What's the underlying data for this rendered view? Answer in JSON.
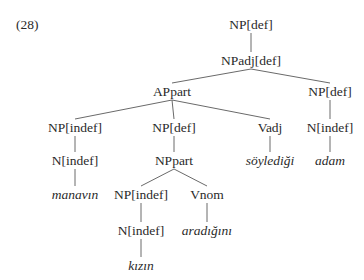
{
  "example_number": "(28)",
  "tree": {
    "nodes": [
      {
        "id": "n1",
        "label": "NP[def]",
        "type": "category"
      },
      {
        "id": "n2",
        "label": "NPadj[def]",
        "type": "category"
      },
      {
        "id": "n3",
        "label": "APpart",
        "type": "category"
      },
      {
        "id": "n4",
        "label": "NP[def]",
        "type": "category"
      },
      {
        "id": "n5",
        "label": "NP[indef]",
        "type": "category"
      },
      {
        "id": "n6",
        "label": "NP[def]",
        "type": "category"
      },
      {
        "id": "n7",
        "label": "Vadj",
        "type": "category"
      },
      {
        "id": "n8",
        "label": "N[indef]",
        "type": "category"
      },
      {
        "id": "n9",
        "label": "N[indef]",
        "type": "category"
      },
      {
        "id": "n10",
        "label": "NPpart",
        "type": "category"
      },
      {
        "id": "n11",
        "label": "söylediği",
        "type": "word"
      },
      {
        "id": "n12",
        "label": "adam",
        "type": "word"
      },
      {
        "id": "n13",
        "label": "manavın",
        "type": "word"
      },
      {
        "id": "n14",
        "label": "NP[indef]",
        "type": "category"
      },
      {
        "id": "n15",
        "label": "Vnom",
        "type": "category"
      },
      {
        "id": "n16",
        "label": "N[indef]",
        "type": "category"
      },
      {
        "id": "n17",
        "label": "aradığını",
        "type": "word"
      },
      {
        "id": "n18",
        "label": "kızın",
        "type": "word"
      }
    ],
    "edges": [
      [
        "n1",
        "n2"
      ],
      [
        "n2",
        "n3"
      ],
      [
        "n2",
        "n4"
      ],
      [
        "n3",
        "n5"
      ],
      [
        "n3",
        "n6"
      ],
      [
        "n3",
        "n7"
      ],
      [
        "n4",
        "n8"
      ],
      [
        "n5",
        "n9"
      ],
      [
        "n6",
        "n10"
      ],
      [
        "n7",
        "n11"
      ],
      [
        "n8",
        "n12"
      ],
      [
        "n9",
        "n13"
      ],
      [
        "n10",
        "n14"
      ],
      [
        "n10",
        "n15"
      ],
      [
        "n14",
        "n16"
      ],
      [
        "n15",
        "n17"
      ],
      [
        "n16",
        "n18"
      ]
    ]
  }
}
